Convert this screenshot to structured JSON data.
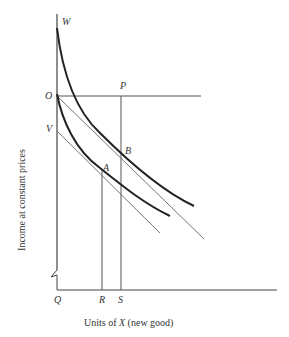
{
  "diagram": {
    "type": "indifference-curve diagram",
    "y_axis_label": "Income at constant prices",
    "x_axis_label_prefix": "Units of ",
    "x_axis_label_var": "X",
    "x_axis_label_suffix": " (new good)",
    "points": {
      "W": "W",
      "O": "O",
      "V": "V",
      "P": "P",
      "A": "A",
      "B": "B",
      "Q": "Q",
      "R": "R",
      "S": "S"
    },
    "elements": [
      "vertical axis from W down to Q with axis break",
      "horizontal axis from Q",
      "horizontal line O–P",
      "upper indifference curve from W through B",
      "lower indifference curve from O through A",
      "budget line from O tangent at B",
      "budget line from V tangent at A",
      "vertical line R up to A",
      "vertical line S up to P through B"
    ]
  }
}
